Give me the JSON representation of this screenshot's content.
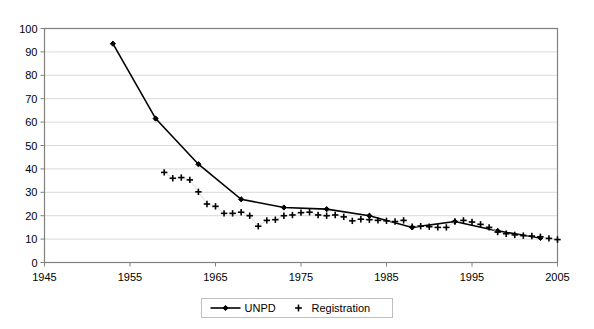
{
  "chart_data": {
    "type": "line",
    "title": "",
    "subtitle": "",
    "xlabel": "",
    "ylabel": "",
    "xlim": [
      1945,
      2005
    ],
    "ylim": [
      0,
      100
    ],
    "grid": true,
    "legend_position": "bottom",
    "y_ticks": [
      0,
      10,
      20,
      30,
      40,
      50,
      60,
      70,
      80,
      90,
      100
    ],
    "y_tick_labels": [
      "0",
      "10",
      "20",
      "30",
      "40",
      "50",
      "60",
      "70",
      "80",
      "90",
      "100"
    ],
    "x_ticks": [
      1945,
      1955,
      1965,
      1975,
      1985,
      1995,
      2005
    ],
    "x_tick_labels": [
      "1945",
      "1955",
      "1965",
      "1975",
      "1985",
      "1995",
      "2005"
    ],
    "series": [
      {
        "name": "UNPD",
        "marker": "diamond",
        "line": true,
        "color": "#000000",
        "points": [
          {
            "x": 1953,
            "y": 93.5
          },
          {
            "x": 1958,
            "y": 61.5
          },
          {
            "x": 1963,
            "y": 42.0
          },
          {
            "x": 1968,
            "y": 27.0
          },
          {
            "x": 1973,
            "y": 23.5
          },
          {
            "x": 1978,
            "y": 22.8
          },
          {
            "x": 1983,
            "y": 20.0
          },
          {
            "x": 1988,
            "y": 15.0
          },
          {
            "x": 1993,
            "y": 17.5
          },
          {
            "x": 1998,
            "y": 13.5
          },
          {
            "x": 2003,
            "y": 10.5
          }
        ]
      },
      {
        "name": "Registration",
        "marker": "plus",
        "line": false,
        "color": "#000000",
        "points": [
          {
            "x": 1959,
            "y": 38.5
          },
          {
            "x": 1960,
            "y": 36.0
          },
          {
            "x": 1961,
            "y": 36.3
          },
          {
            "x": 1962,
            "y": 35.3
          },
          {
            "x": 1963,
            "y": 30.2
          },
          {
            "x": 1964,
            "y": 25.0
          },
          {
            "x": 1965,
            "y": 24.0
          },
          {
            "x": 1966,
            "y": 21.0
          },
          {
            "x": 1967,
            "y": 21.0
          },
          {
            "x": 1968,
            "y": 21.5
          },
          {
            "x": 1969,
            "y": 20.0
          },
          {
            "x": 1970,
            "y": 15.5
          },
          {
            "x": 1971,
            "y": 18.0
          },
          {
            "x": 1972,
            "y": 18.3
          },
          {
            "x": 1973,
            "y": 20.0
          },
          {
            "x": 1974,
            "y": 20.3
          },
          {
            "x": 1975,
            "y": 21.3
          },
          {
            "x": 1976,
            "y": 21.5
          },
          {
            "x": 1977,
            "y": 20.3
          },
          {
            "x": 1978,
            "y": 20.0
          },
          {
            "x": 1979,
            "y": 20.3
          },
          {
            "x": 1980,
            "y": 19.5
          },
          {
            "x": 1981,
            "y": 17.8
          },
          {
            "x": 1982,
            "y": 18.5
          },
          {
            "x": 1983,
            "y": 18.3
          },
          {
            "x": 1984,
            "y": 18.0
          },
          {
            "x": 1985,
            "y": 17.8
          },
          {
            "x": 1986,
            "y": 17.5
          },
          {
            "x": 1987,
            "y": 18.0
          },
          {
            "x": 1988,
            "y": 15.3
          },
          {
            "x": 1989,
            "y": 15.5
          },
          {
            "x": 1990,
            "y": 15.3
          },
          {
            "x": 1991,
            "y": 15.0
          },
          {
            "x": 1992,
            "y": 15.0
          },
          {
            "x": 1993,
            "y": 17.5
          },
          {
            "x": 1994,
            "y": 18.0
          },
          {
            "x": 1995,
            "y": 17.3
          },
          {
            "x": 1996,
            "y": 16.3
          },
          {
            "x": 1997,
            "y": 15.0
          },
          {
            "x": 1998,
            "y": 13.0
          },
          {
            "x": 1999,
            "y": 12.3
          },
          {
            "x": 2000,
            "y": 11.8
          },
          {
            "x": 2001,
            "y": 11.5
          },
          {
            "x": 2002,
            "y": 11.3
          },
          {
            "x": 2003,
            "y": 11.0
          },
          {
            "x": 2004,
            "y": 10.3
          },
          {
            "x": 2005,
            "y": 9.8
          }
        ]
      }
    ],
    "legend": [
      {
        "label": "UNPD",
        "marker": "diamond-line"
      },
      {
        "label": "Registration",
        "marker": "plus"
      }
    ]
  },
  "colors": {
    "series": "#000000",
    "grid": "#d9d9d9",
    "axis": "#808080",
    "background": "#ffffff",
    "legend_border": "#bfbfbf"
  }
}
